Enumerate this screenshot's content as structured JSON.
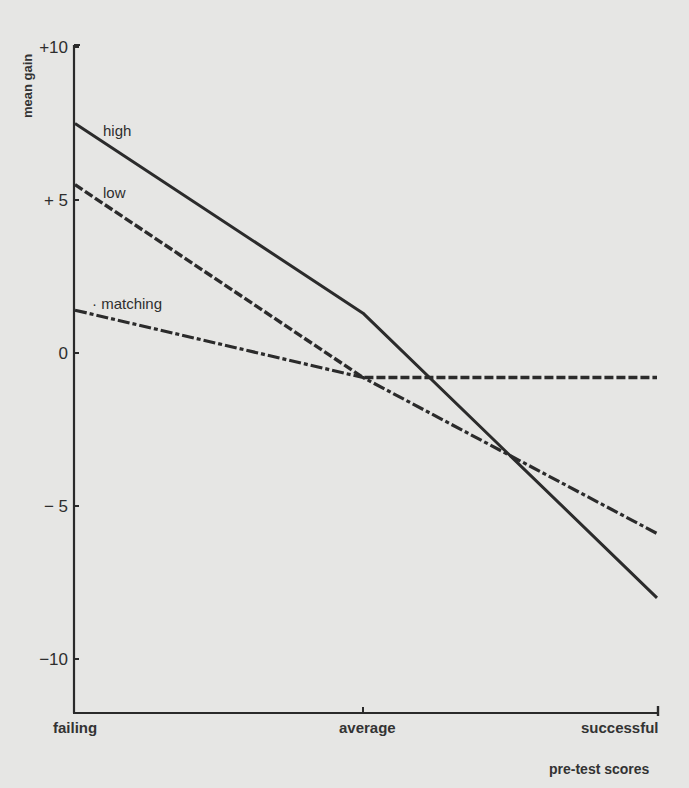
{
  "chart_data": {
    "type": "line",
    "title": "",
    "xlabel": "pre-test scores",
    "ylabel": "mean gain",
    "categories": [
      "failing",
      "average",
      "successful"
    ],
    "ylim": [
      -12,
      10
    ],
    "yticks": [
      10,
      5,
      0,
      -5,
      -10
    ],
    "ytick_labels": [
      "+10",
      "+ 5",
      "0",
      "− 5",
      "−10"
    ],
    "grid": false,
    "legend": "inline labels near left end of each line",
    "series": [
      {
        "name": "high",
        "style": "solid",
        "values": [
          7.5,
          1.3,
          -8.0
        ]
      },
      {
        "name": "low",
        "style": "dashed",
        "values": [
          5.5,
          -0.8,
          -0.8
        ]
      },
      {
        "name": "matching",
        "style": "dash-dot",
        "values": [
          1.4,
          -0.8,
          -5.9
        ]
      }
    ]
  },
  "axis": {
    "y_title": "mean gain",
    "x_title": "pre-test scores"
  },
  "labels": {
    "high": "high",
    "low": "low",
    "matching": "· matching"
  },
  "colors": {
    "background": "#e6e6e4",
    "ink": "#2a2a2a"
  }
}
